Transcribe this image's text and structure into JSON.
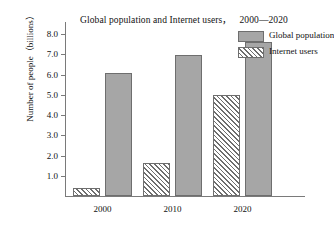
{
  "chart_data": {
    "type": "bar",
    "title": "Global population and Internet users",
    "title_range": "2000—2020",
    "xlabel": "",
    "ylabel": "Number of people（billions）",
    "categories": [
      "2000",
      "2010",
      "2020"
    ],
    "series": [
      {
        "name": "Global population",
        "values": [
          6.1,
          6.95,
          7.6
        ],
        "fill": "solid-gray",
        "color": "#a6a6a6"
      },
      {
        "name": "Internet users",
        "values": [
          0.4,
          1.65,
          5.0
        ],
        "fill": "diagonal-hatch",
        "color": "#ffffff"
      }
    ],
    "ylim": [
      0,
      8.6
    ],
    "yticks": [
      "1.0",
      "2.0",
      "3.0",
      "4.0",
      "5.0",
      "6.0",
      "7.0",
      "8.0"
    ],
    "ytick_values": [
      1.0,
      2.0,
      3.0,
      4.0,
      5.0,
      6.0,
      7.0,
      8.0
    ],
    "grid": false,
    "legend_position": "top-right-outside"
  }
}
